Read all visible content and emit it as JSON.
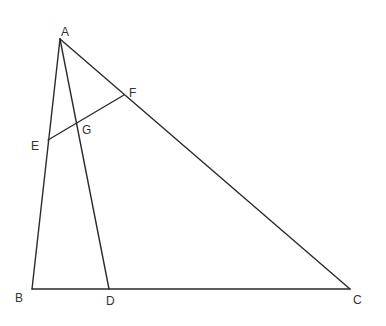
{
  "diagram": {
    "type": "geometry-triangle",
    "points": {
      "A": {
        "label": "A",
        "x": 60,
        "y": 39
      },
      "B": {
        "label": "B",
        "x": 32,
        "y": 289
      },
      "C": {
        "label": "C",
        "x": 350,
        "y": 289
      },
      "D": {
        "label": "D",
        "x": 109,
        "y": 289
      },
      "E": {
        "label": "E",
        "x": 48,
        "y": 140
      },
      "F": {
        "label": "F",
        "x": 124,
        "y": 95
      },
      "G": {
        "label": "G",
        "x": 77,
        "y": 123
      }
    },
    "segments": [
      {
        "name": "AB",
        "from": "A",
        "to": "B"
      },
      {
        "name": "AC",
        "from": "A",
        "to": "C"
      },
      {
        "name": "BC",
        "from": "B",
        "to": "C"
      },
      {
        "name": "AD",
        "from": "A",
        "to": "D"
      },
      {
        "name": "EF",
        "from": "E",
        "to": "F"
      }
    ],
    "labels": [
      {
        "text": "A",
        "x": 61,
        "y": 36
      },
      {
        "text": "B",
        "x": 15,
        "y": 302
      },
      {
        "text": "C",
        "x": 353,
        "y": 304
      },
      {
        "text": "D",
        "x": 106,
        "y": 305
      },
      {
        "text": "E",
        "x": 31,
        "y": 150
      },
      {
        "text": "F",
        "x": 129,
        "y": 97
      },
      {
        "text": "G",
        "x": 82,
        "y": 134
      }
    ]
  }
}
